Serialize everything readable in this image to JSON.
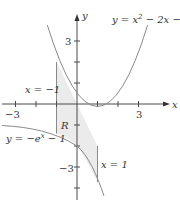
{
  "diagram": {
    "type": "graph-region-between-curves",
    "axes": {
      "x_label": "x",
      "y_label": "y",
      "x_ticks": [
        -3,
        -2,
        -1,
        0,
        1,
        2,
        3
      ],
      "y_ticks": [
        -4,
        -3,
        -2,
        -1,
        0,
        1,
        2,
        3
      ],
      "x_tick_labels": {
        "neg": "−3",
        "pos": "3"
      },
      "y_tick_labels": {
        "pos": "3",
        "neg": "−3"
      }
    },
    "curves": {
      "parabola": {
        "equation": "y = x² − 2x − 1",
        "label_main": "y = x",
        "label_sup": "2",
        "label_rest": " − 2x − 1"
      },
      "exponential": {
        "equation": "y = −eˣ − 1",
        "label_main": "y = −e",
        "label_sup": "x",
        "label_rest": " − 1"
      }
    },
    "boundaries": {
      "left": "x = −1",
      "right": "x = 1"
    },
    "region_label": "R",
    "colors": {
      "curve": "#8a8a8a",
      "axis": "#4a4a4a",
      "region_fill": "#ebebeb",
      "text": "#333333"
    }
  }
}
